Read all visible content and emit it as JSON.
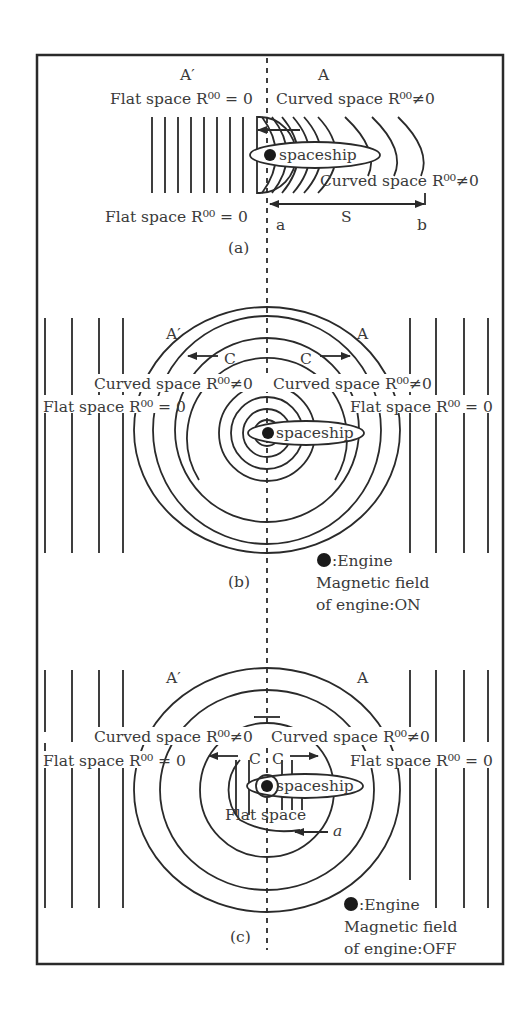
{
  "figure": {
    "colors": {
      "ink": "#2a2a2a",
      "text": "#3a3a3a",
      "background": "#ffffff"
    },
    "panels": [
      {
        "id": "a",
        "caption": "(a)",
        "left_region": "A′",
        "right_region": "A",
        "top_left_label": "Flat space R⁰⁰ = 0",
        "top_right_label": "Curved space R⁰⁰≠0",
        "spaceship_label": "spaceship",
        "curved_label": "Curved space R⁰⁰≠0",
        "bottom_left_label": "Flat space R⁰⁰ = 0",
        "point_a": "a",
        "distance": "S",
        "point_b": "b"
      },
      {
        "id": "b",
        "caption": "(b)",
        "left_region": "A′",
        "right_region": "A",
        "left_arrow_label": "C",
        "right_arrow_label": "C",
        "curved_left": "Curved space R⁰⁰≠0",
        "curved_right": "Curved space R⁰⁰≠0",
        "flat_left": "Flat space R⁰⁰ = 0",
        "flat_right": "Flat space R⁰⁰ = 0",
        "spaceship_label": "spaceship",
        "legend_engine": ":Engine",
        "legend_line1": "Magnetic field",
        "legend_line2": "of engine:ON"
      },
      {
        "id": "c",
        "caption": "(c)",
        "left_region": "A′",
        "right_region": "A",
        "left_arrow_label": "C",
        "right_arrow_label": "C",
        "curved_left": "Curved space R⁰⁰≠0",
        "curved_right": "Curved space R⁰⁰≠0",
        "flat_left": "Flat space R⁰⁰ = 0",
        "flat_right": "Flat space R⁰⁰ = 0",
        "spaceship_label": "spaceship",
        "inner_label": "Flat space",
        "alpha_label": "a",
        "legend_engine": ":Engine",
        "legend_line1": "Magnetic field",
        "legend_line2": "of engine:OFF"
      }
    ]
  }
}
